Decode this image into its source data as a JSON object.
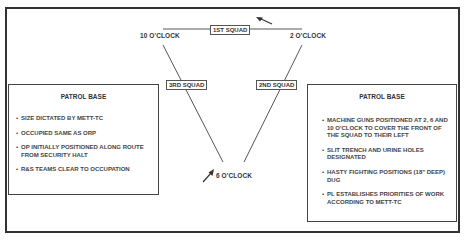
{
  "diagram": {
    "positions": {
      "ten_oclock": "10 O'CLOCK",
      "two_oclock": "2 O'CLOCK",
      "six_oclock": "6 O'CLOCK"
    },
    "squads": {
      "first": "1ST SQUAD",
      "second": "2ND SQUAD",
      "third": "3RD SQUAD"
    },
    "icons": [
      "arrow-icon-top",
      "arrow-icon-bottom"
    ]
  },
  "left_panel": {
    "title": "PATROL BASE",
    "items": [
      "SIZE DICTATED BY METT-TC",
      "OCCUPIED SAME AS ORP",
      "OP INITIALLY POSITIONED ALONG ROUTE FROM SECURITY HALT",
      "R&S TEAMS CLEAR TO OCCUPATION"
    ]
  },
  "right_panel": {
    "title": "PATROL BASE",
    "items": [
      "MACHINE GUNS POSITIONED AT 2, 6 AND 10 O'CLOCK TO COVER THE FRONT OF THE SQUAD TO THEIR LEFT",
      "SLIT TRENCH AND URINE HOLES DESIGNATED",
      "HASTY FIGHTING POSITIONS (18\" DEEP) DUG",
      "PL ESTABLISHES PRIORITIES OF WORK ACCORDING TO METT-TC"
    ]
  },
  "colors": {
    "line": "#555555",
    "border": "#333333",
    "text": "#333333"
  }
}
